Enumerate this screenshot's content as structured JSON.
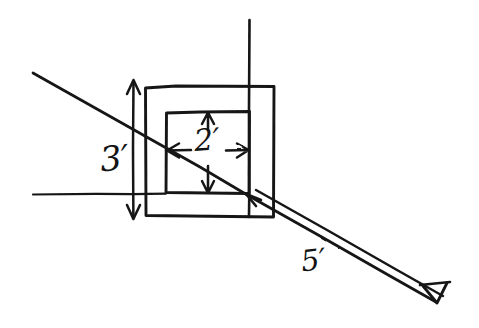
{
  "figure": {
    "kind": "hand-drawn-geometry-sketch",
    "background_color": "#ffffff",
    "ink_color": "#141414",
    "width": 479,
    "height": 328
  },
  "labels": {
    "outer_height": "3′",
    "inner_width": "2′",
    "diagonal_length": "5′"
  },
  "shapes": {
    "outer_square": {
      "name": "outer-square",
      "x": 145,
      "y": 86,
      "width": 129,
      "height": 131
    },
    "inner_square": {
      "name": "inner-square",
      "x": 166,
      "y": 112,
      "width": 83,
      "height": 81
    }
  },
  "guides": {
    "vertical_axis": {
      "name": "vertical-guide-line",
      "x": 249,
      "y_top": 20,
      "y_bottom": 217
    },
    "horizontal_axis": {
      "name": "horizontal-guide-line",
      "y": 194,
      "x_left": 33,
      "x_right": 160
    }
  },
  "diagonal": {
    "name": "diagonal-ray",
    "x1": 33,
    "y1": 73,
    "x2": 437,
    "y2": 302,
    "has_arrowhead": true,
    "double_line_from": 249
  },
  "dimensions": {
    "vertical_three": {
      "x": 133,
      "y_top": 80,
      "y_bottom": 218,
      "arrows": "both-ends"
    },
    "horizontal_two": {
      "y": 150,
      "x_left": 166,
      "x_right": 249,
      "arrows": "both-ends"
    },
    "vertical_two": {
      "x": 208,
      "y_top": 112,
      "y_bottom": 193,
      "arrows": "both-ends"
    },
    "diagonal_five_start_arrow": {
      "x": 249,
      "y": 196,
      "direction": "up-left"
    }
  }
}
